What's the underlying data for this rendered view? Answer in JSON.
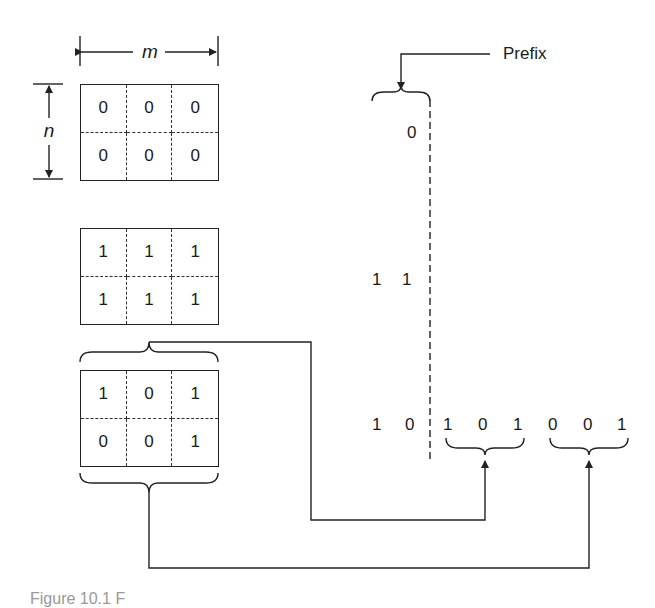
{
  "dimensions": {
    "width_label": "m",
    "height_label": "n"
  },
  "grids": [
    {
      "name": "all-zeros",
      "rows": [
        [
          "0",
          "0",
          "0"
        ],
        [
          "0",
          "0",
          "0"
        ]
      ]
    },
    {
      "name": "all-ones",
      "rows": [
        [
          "1",
          "1",
          "1"
        ],
        [
          "1",
          "1",
          "1"
        ]
      ]
    },
    {
      "name": "mixed",
      "rows": [
        [
          "1",
          "0",
          "1"
        ],
        [
          "0",
          "0",
          "1"
        ]
      ]
    }
  ],
  "prefix": {
    "label": "Prefix",
    "rows": [
      {
        "bits": [
          "0"
        ]
      },
      {
        "bits": [
          "1",
          "1"
        ]
      },
      {
        "bits": [
          "1",
          "0"
        ]
      }
    ]
  },
  "encoded": {
    "row1": [
      "1",
      "0",
      "1"
    ],
    "row2": [
      "0",
      "0",
      "1"
    ]
  },
  "caption": "Figure 10.1  F"
}
